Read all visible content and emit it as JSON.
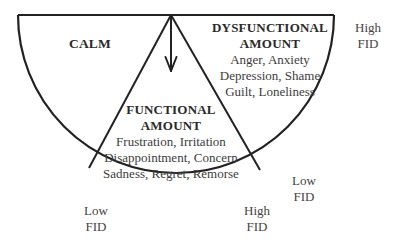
{
  "diagram": {
    "regions": {
      "calm": {
        "title": "CALM"
      },
      "functional": {
        "title_line1": "FUNCTIONAL",
        "title_line2": "AMOUNT",
        "emotions": [
          "Frustration, Irritation",
          "Disappointment, Concern",
          "Sadness, Regret, Remorse"
        ]
      },
      "dysfunctional": {
        "title_line1": "DYSFUNCTIONAL",
        "title_line2": "AMOUNT",
        "emotions": [
          "Anger, Anxiety",
          "Depression, Shame",
          "Guilt, Loneliness"
        ]
      }
    },
    "fid_labels": {
      "top_right": {
        "line1": "High",
        "line2": "FID"
      },
      "bottom_left": {
        "line1": "Low",
        "line2": "FID"
      },
      "bottom_center": {
        "line1": "High",
        "line2": "FID"
      },
      "bottom_right": {
        "line1": "Low",
        "line2": "FID"
      }
    },
    "colors": {
      "stroke": "#222222",
      "text": "#333333",
      "background": "#ffffff"
    }
  }
}
